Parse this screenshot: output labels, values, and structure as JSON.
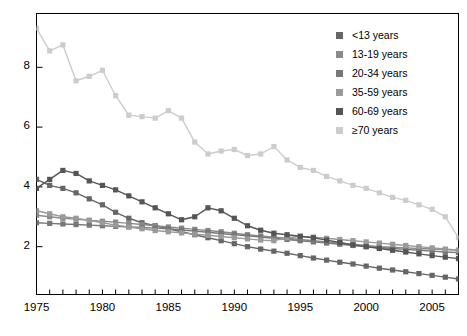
{
  "chart_data": {
    "type": "line",
    "title": "",
    "xlabel": "",
    "ylabel": "",
    "xlim": [
      1975,
      2007
    ],
    "ylim": [
      0.4,
      9.8
    ],
    "xticks": [
      1975,
      1976,
      1977,
      1978,
      1979,
      1980,
      1981,
      1982,
      1983,
      1984,
      1985,
      1986,
      1987,
      1988,
      1989,
      1990,
      1991,
      1992,
      1993,
      1994,
      1995,
      1996,
      1997,
      1998,
      1999,
      2000,
      2001,
      2002,
      2003,
      2004,
      2005,
      2006,
      2007
    ],
    "xtick_labels": [
      "1975",
      "1980",
      "1985",
      "1990",
      "1995",
      "2000",
      "2005"
    ],
    "xtick_label_values": [
      1975,
      1980,
      1985,
      1990,
      1995,
      2000,
      2005
    ],
    "yticks": [
      2,
      4,
      6,
      8
    ],
    "ytick_labels": [
      "2",
      "4",
      "6",
      "8"
    ],
    "grid": false,
    "legend_position": "top-right",
    "marker": "square",
    "x": [
      1975,
      1976,
      1977,
      1978,
      1979,
      1980,
      1981,
      1982,
      1983,
      1984,
      1985,
      1986,
      1987,
      1988,
      1989,
      1990,
      1991,
      1992,
      1993,
      1994,
      1995,
      1996,
      1997,
      1998,
      1999,
      2000,
      2001,
      2002,
      2003,
      2004,
      2005,
      2006,
      2007
    ],
    "series": [
      {
        "name": "<13 years",
        "color": "#666666",
        "values": [
          4.25,
          4.05,
          3.95,
          3.8,
          3.6,
          3.4,
          3.15,
          2.95,
          2.8,
          2.7,
          2.6,
          2.5,
          2.4,
          2.3,
          2.2,
          2.1,
          2.0,
          1.92,
          1.85,
          1.78,
          1.7,
          1.62,
          1.55,
          1.48,
          1.42,
          1.35,
          1.28,
          1.22,
          1.16,
          1.1,
          1.04,
          0.98,
          0.92
        ]
      },
      {
        "name": "13-19 years",
        "color": "#8a8a8a",
        "values": [
          3.05,
          3.0,
          2.95,
          2.92,
          2.88,
          2.85,
          2.82,
          2.78,
          2.74,
          2.7,
          2.66,
          2.62,
          2.58,
          2.54,
          2.5,
          2.45,
          2.4,
          2.36,
          2.32,
          2.28,
          2.24,
          2.2,
          2.16,
          2.12,
          2.08,
          2.04,
          2.0,
          1.98,
          1.96,
          1.94,
          1.92,
          1.9,
          1.88
        ]
      },
      {
        "name": "20-34 years",
        "color": "#777777",
        "values": [
          2.8,
          2.78,
          2.76,
          2.74,
          2.72,
          2.7,
          2.68,
          2.66,
          2.64,
          2.62,
          2.6,
          2.56,
          2.52,
          2.48,
          2.44,
          2.4,
          2.36,
          2.32,
          2.28,
          2.24,
          2.2,
          2.16,
          2.12,
          2.08,
          2.04,
          2.0,
          1.97,
          1.94,
          1.91,
          1.88,
          1.85,
          1.82,
          1.8
        ]
      },
      {
        "name": "35-59 years",
        "color": "#9a9a9a",
        "values": [
          3.2,
          3.1,
          3.0,
          2.95,
          2.88,
          2.8,
          2.72,
          2.66,
          2.6,
          2.54,
          2.5,
          2.46,
          2.42,
          2.38,
          2.34,
          2.3,
          2.26,
          2.22,
          2.2,
          2.3,
          2.34,
          2.32,
          2.28,
          2.24,
          2.2,
          2.16,
          2.12,
          2.08,
          2.04,
          2.0,
          1.96,
          1.92,
          1.88
        ]
      },
      {
        "name": "60-69 years",
        "color": "#555555",
        "values": [
          3.95,
          4.25,
          4.55,
          4.45,
          4.2,
          4.05,
          3.9,
          3.7,
          3.5,
          3.3,
          3.1,
          2.9,
          3.0,
          3.3,
          3.2,
          2.95,
          2.7,
          2.55,
          2.45,
          2.4,
          2.35,
          2.3,
          2.22,
          2.14,
          2.06,
          2.0,
          1.94,
          1.88,
          1.82,
          1.76,
          1.7,
          1.65,
          1.6
        ]
      },
      {
        "name": "≥70 years",
        "color": "#cccccc",
        "values": [
          9.3,
          8.55,
          8.75,
          7.55,
          7.7,
          7.9,
          7.05,
          6.4,
          6.35,
          6.3,
          6.55,
          6.3,
          5.5,
          5.1,
          5.2,
          5.25,
          5.05,
          5.1,
          5.35,
          4.9,
          4.65,
          4.55,
          4.35,
          4.2,
          4.05,
          3.95,
          3.8,
          3.65,
          3.55,
          3.4,
          3.25,
          3.0,
          2.3
        ]
      }
    ]
  },
  "legend": {
    "items": [
      {
        "label": "<13 years",
        "color": "#666666"
      },
      {
        "label": "13-19 years",
        "color": "#8a8a8a"
      },
      {
        "label": "20-34 years",
        "color": "#777777"
      },
      {
        "label": "35-59 years",
        "color": "#9a9a9a"
      },
      {
        "label": "60-69 years",
        "color": "#555555"
      },
      {
        "label": "≥70 years",
        "color": "#cccccc"
      }
    ]
  },
  "axis": {
    "frame_color": "#000000",
    "tick_color": "#000000"
  }
}
